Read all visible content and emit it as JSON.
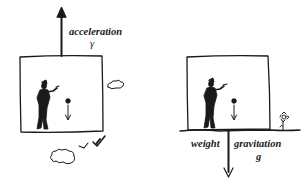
{
  "left_panel": {
    "arrow_label": "acceleration",
    "arrow_symbol": "γ",
    "scene": "person in box accelerating upward, dropped ball falls"
  },
  "right_panel": {
    "left_label": "weight",
    "right_label": "gravitation",
    "right_symbol": "g",
    "scene": "person in box resting on ground, dropped ball falls"
  },
  "colors": {
    "ink": "#1a1a1a",
    "background": "#ffffff"
  }
}
